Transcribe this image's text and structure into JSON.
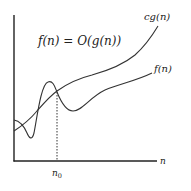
{
  "diagram": {
    "title_equation": "f(n) = O(g(n))",
    "x_axis_label": "n",
    "threshold_label": "n",
    "threshold_subscript": "0",
    "curves": [
      {
        "name": "cg(n)",
        "label": "cg(n)",
        "description": "upper bound, smooth increasing"
      },
      {
        "name": "f(n)",
        "label": "f(n)",
        "description": "oscillates then stays below cg(n) for n >= n0"
      }
    ],
    "colors": {
      "curve": "#333333",
      "axis": "#222222",
      "background": "#ffffff"
    }
  }
}
